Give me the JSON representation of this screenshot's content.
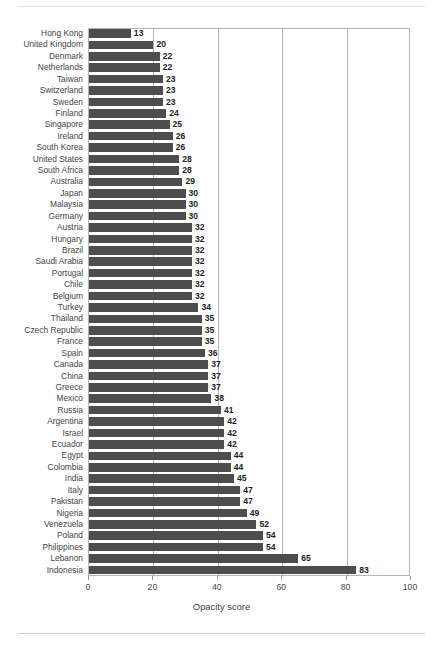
{
  "chart_data": {
    "type": "bar",
    "orientation": "horizontal",
    "title": "",
    "subtitle": "",
    "xlabel": "Opacity score",
    "ylabel": "",
    "xlim": [
      0,
      100
    ],
    "xticks": [
      0,
      20,
      40,
      60,
      80,
      100
    ],
    "xtick_labels": [
      "0",
      "20",
      "40",
      "60",
      "80",
      "100"
    ],
    "grid": "vertical",
    "legend": "none",
    "bar_color": "#4d4d4d",
    "value_labels": true,
    "categories": [
      "Hong Kong",
      "United Kingdom",
      "Denmark",
      "Netherlands",
      "Taiwan",
      "Switzerland",
      "Sweden",
      "Finland",
      "Singapore",
      "Ireland",
      "South Korea",
      "United States",
      "South Africa",
      "Australia",
      "Japan",
      "Malaysia",
      "Germany",
      "Austria",
      "Hungary",
      "Brazil",
      "Saudi Arabia",
      "Portugal",
      "Chile",
      "Belgium",
      "Turkey",
      "Thailand",
      "Czech Republic",
      "France",
      "Spain",
      "Canada",
      "China",
      "Greece",
      "Mexico",
      "Russia",
      "Argentina",
      "Israel",
      "Ecuador",
      "Egypt",
      "Colombia",
      "India",
      "Italy",
      "Pakistan",
      "Nigeria",
      "Venezuela",
      "Poland",
      "Philippines",
      "Lebanon",
      "Indonesia"
    ],
    "values": [
      13,
      20,
      22,
      22,
      23,
      23,
      23,
      24,
      25,
      26,
      26,
      28,
      28,
      29,
      30,
      30,
      30,
      32,
      32,
      32,
      32,
      32,
      32,
      32,
      34,
      35,
      35,
      35,
      36,
      37,
      37,
      37,
      38,
      41,
      42,
      42,
      42,
      44,
      44,
      45,
      47,
      47,
      49,
      52,
      54,
      54,
      65,
      83
    ]
  }
}
